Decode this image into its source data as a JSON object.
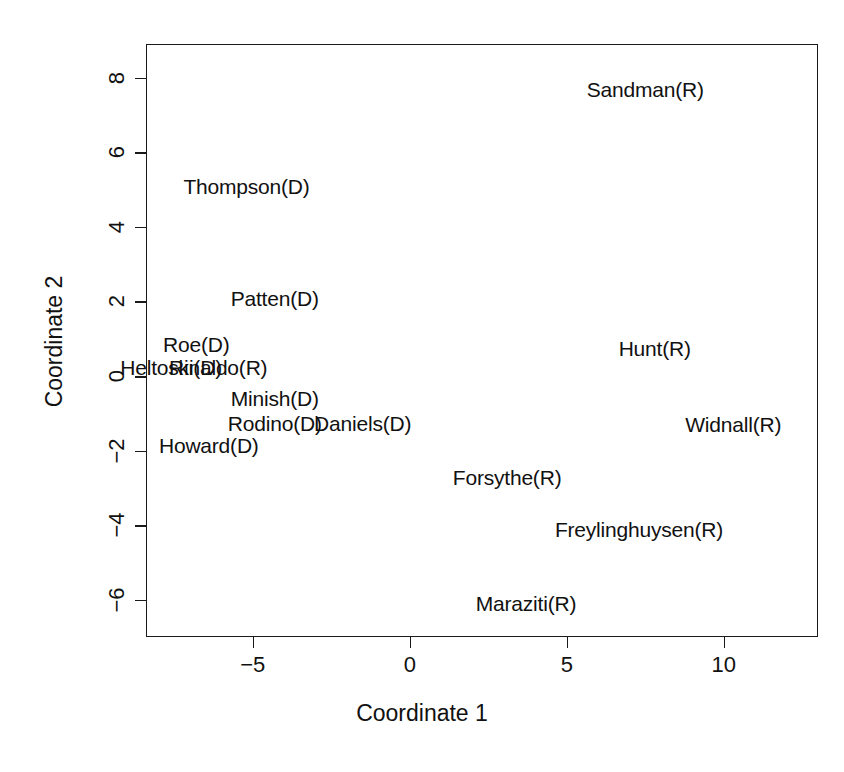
{
  "chart_data": {
    "type": "scatter",
    "title": "",
    "xlabel": "Coordinate 1",
    "ylabel": "Coordinate 2",
    "xlim": [
      -8.4,
      13.0
    ],
    "ylim": [
      -7.0,
      8.9
    ],
    "xticks": [
      -5,
      0,
      5,
      10
    ],
    "xticklabels": [
      "-5",
      "0",
      "5",
      "10"
    ],
    "yticks": [
      8,
      6,
      4,
      2,
      0,
      -2,
      -4,
      -6
    ],
    "yticklabels": [
      "8",
      "6",
      "4",
      "2",
      "0",
      "-2",
      "-4",
      "-6"
    ],
    "grid": false,
    "legend": null,
    "marker_style": "text-label",
    "points": [
      {
        "label": "Sandman(R)",
        "x": 7.5,
        "y": 7.7
      },
      {
        "label": "Thompson(D)",
        "x": -5.2,
        "y": 5.1
      },
      {
        "label": "Patten(D)",
        "x": -4.3,
        "y": 2.1
      },
      {
        "label": "Roe(D)",
        "x": -6.8,
        "y": 0.85
      },
      {
        "label": "Hunt(R)",
        "x": 7.8,
        "y": 0.75
      },
      {
        "label": "Heltoski(D)",
        "x": -7.6,
        "y": 0.25
      },
      {
        "label": "Rinaldo(R)",
        "x": -6.1,
        "y": 0.25
      },
      {
        "label": "Minish(D)",
        "x": -4.3,
        "y": -0.6
      },
      {
        "label": "Rodino(D)",
        "x": -4.3,
        "y": -1.25
      },
      {
        "label": "Daniels(D)",
        "x": -1.5,
        "y": -1.25
      },
      {
        "label": "Widnall(R)",
        "x": 10.3,
        "y": -1.3
      },
      {
        "label": "Howard(D)",
        "x": -6.4,
        "y": -1.85
      },
      {
        "label": "Forsythe(R)",
        "x": 3.1,
        "y": -2.7
      },
      {
        "label": "Freylinghuysen(R)",
        "x": 7.3,
        "y": -4.1
      },
      {
        "label": "Maraziti(R)",
        "x": 3.7,
        "y": -6.1
      }
    ]
  },
  "colors": {
    "axis": "#1a1a1a",
    "text": "#111111",
    "background": "#ffffff"
  }
}
